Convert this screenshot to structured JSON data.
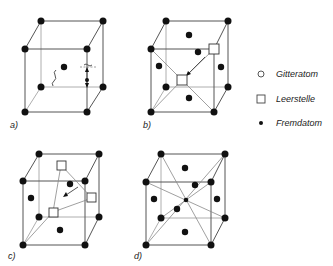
{
  "panels": [
    {
      "id": "a",
      "label": "a)"
    },
    {
      "id": "b",
      "label": "b)"
    },
    {
      "id": "c",
      "label": "c)"
    },
    {
      "id": "d",
      "label": "d)"
    }
  ],
  "legend": {
    "items": [
      {
        "symbol": "open-circle",
        "label": "Gitteratom"
      },
      {
        "symbol": "open-square",
        "label": "Leerstelle"
      },
      {
        "symbol": "filled-dot",
        "label": "Fremdatom"
      }
    ]
  },
  "colors": {
    "atom": "#111111",
    "edge": "#555555",
    "background": "#ffffff"
  }
}
